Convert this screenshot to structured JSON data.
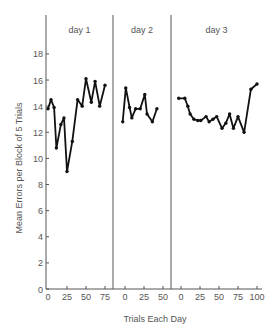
{
  "chart_data": {
    "type": "line",
    "title": "",
    "xlabel": "Trials Each Day",
    "ylabel": "Mean Errors per Block of 5 Trials",
    "ylim": [
      0,
      20
    ],
    "yticks": [
      0,
      2,
      4,
      6,
      8,
      10,
      12,
      14,
      16,
      18
    ],
    "grid": false,
    "legend": null,
    "panels": [
      {
        "name": "day 1",
        "xticks": [
          0,
          25,
          50,
          75
        ],
        "xmax": 85,
        "x": [
          0,
          4,
          8,
          11,
          17,
          21,
          25,
          32,
          39,
          45,
          50,
          57,
          62,
          68,
          75
        ],
        "values": [
          13.8,
          14.5,
          13.9,
          10.8,
          12.6,
          13.1,
          9.0,
          11.3,
          14.5,
          14.0,
          16.1,
          14.3,
          15.9,
          14.0,
          15.6
        ]
      },
      {
        "name": "day 2",
        "xticks": [
          0,
          25,
          50
        ],
        "xmax": 60,
        "x": [
          -3,
          1,
          6,
          9,
          14,
          20,
          26,
          29,
          36,
          42
        ],
        "values": [
          12.8,
          15.4,
          13.9,
          13.1,
          13.8,
          13.8,
          14.9,
          13.4,
          12.8,
          13.8
        ]
      },
      {
        "name": "day 3",
        "xticks": [
          0,
          25,
          50,
          75,
          100
        ],
        "xmax": 105,
        "x": [
          -3,
          5,
          9,
          12,
          17,
          22,
          26,
          33,
          37,
          42,
          47,
          54,
          59,
          64,
          69,
          75,
          83,
          92,
          100
        ],
        "values": [
          14.6,
          14.6,
          14.0,
          13.4,
          13.0,
          12.9,
          12.9,
          13.2,
          12.8,
          13.0,
          13.2,
          12.3,
          12.7,
          13.4,
          12.3,
          13.2,
          12.0,
          15.3,
          15.7
        ]
      }
    ]
  }
}
